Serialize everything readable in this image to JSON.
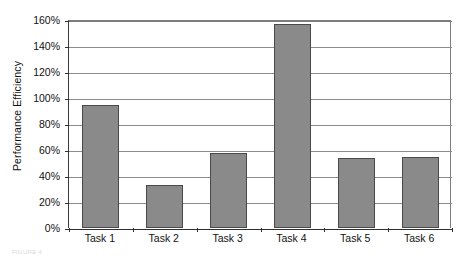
{
  "chart_data": {
    "type": "bar",
    "title": "",
    "subtitle": "",
    "xlabel": "",
    "ylabel": "Performance Efficiency",
    "categories": [
      "Task 1",
      "Task 2",
      "Task 3",
      "Task 4",
      "Task 5",
      "Task 6"
    ],
    "values": [
      95,
      33,
      58,
      157,
      54,
      55
    ],
    "value_labels": [
      "95%",
      "33%",
      "58%",
      "157%",
      "54%",
      "55%"
    ],
    "ylim": [
      0,
      160
    ],
    "ytick_values": [
      0,
      20,
      40,
      60,
      80,
      100,
      120,
      140,
      160
    ],
    "ytick_labels": [
      "0%",
      "20%",
      "40%",
      "60%",
      "80%",
      "100%",
      "120%",
      "140%",
      "160%"
    ],
    "grid": "horizontal",
    "legend": "none",
    "bar_color": "#8a8a8a",
    "bar_border_color": "#4a4a4a",
    "gridline_color": "#8c8c8c",
    "axis_color": "#2f2f2f",
    "background_color": "#ffffff",
    "text_color": "#111111"
  },
  "caption": {
    "fragment": "FIGURE 4"
  }
}
